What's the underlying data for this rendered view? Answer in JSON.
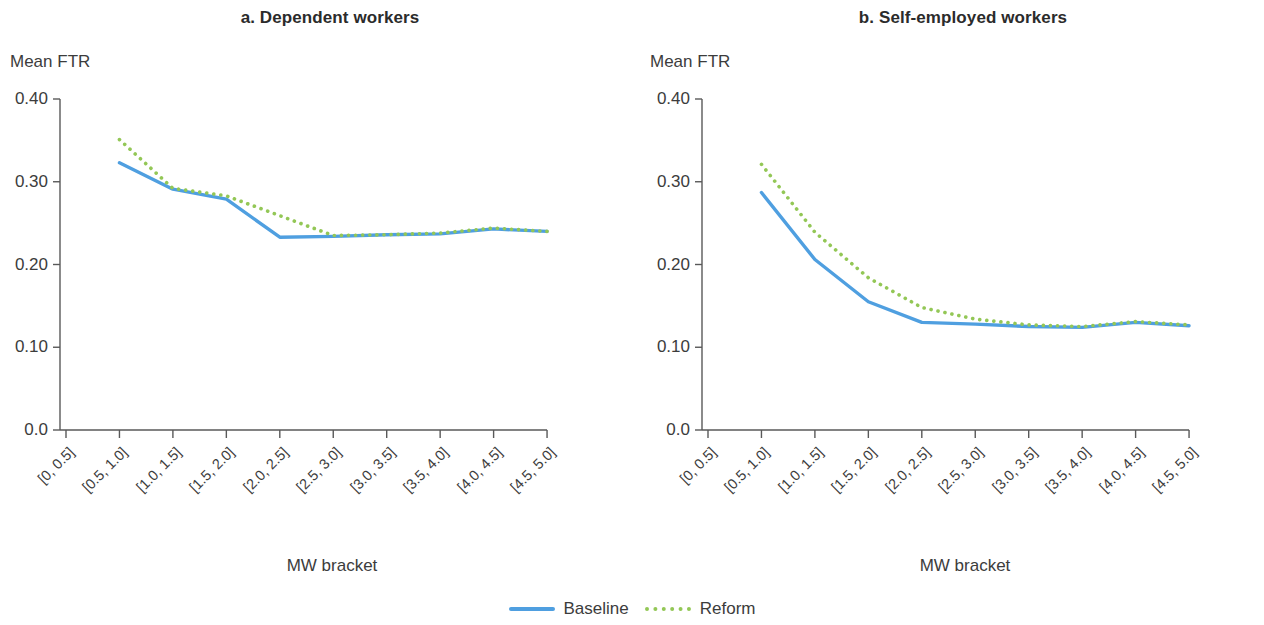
{
  "figure": {
    "background": "#ffffff",
    "series_colors": {
      "baseline": "#4f9fe0",
      "reform": "#93c756"
    }
  },
  "legend": {
    "position": "bottom-center",
    "items": [
      {
        "label": "Baseline",
        "style": "solid",
        "color": "#4f9fe0",
        "icon": "solid-line-swatch"
      },
      {
        "label": "Reform",
        "style": "dotted",
        "color": "#93c756",
        "icon": "dotted-line-swatch"
      }
    ]
  },
  "chart_data": [
    {
      "type": "line",
      "title": "a. Dependent workers",
      "xlabel": "MW bracket",
      "ylabel": "Mean FTR",
      "ylim": [
        0.0,
        0.4
      ],
      "yticks": [
        "0.0",
        "0.10",
        "0.20",
        "0.30",
        "0.40"
      ],
      "ytick_values": [
        0.0,
        0.1,
        0.2,
        0.3,
        0.4
      ],
      "grid": false,
      "legend_position": "bottom-center",
      "categories": [
        "[0, 0.5]",
        "[0.5, 1.0]",
        "[1.0, 1.5]",
        "[1.5, 2.0]",
        "[2.0, 2.5]",
        "[2.5, 3.0]",
        "[3.0, 3.5]",
        "[3.5, 4.0]",
        "[4.0, 4.5]",
        "[4.5, 5.0]"
      ],
      "series": [
        {
          "name": "Baseline",
          "style": "solid",
          "color": "#4f9fe0",
          "values": [
            null,
            0.323,
            0.291,
            0.279,
            0.233,
            0.234,
            0.236,
            0.237,
            0.243,
            0.24
          ]
        },
        {
          "name": "Reform",
          "style": "dotted",
          "color": "#93c756",
          "values": [
            null,
            0.351,
            0.292,
            0.283,
            0.259,
            0.235,
            0.236,
            0.238,
            0.244,
            0.24
          ]
        }
      ]
    },
    {
      "type": "line",
      "title": "b. Self-employed workers",
      "xlabel": "MW bracket",
      "ylabel": "Mean FTR",
      "ylim": [
        0.0,
        0.4
      ],
      "yticks": [
        "0.0",
        "0.10",
        "0.20",
        "0.30",
        "0.40"
      ],
      "ytick_values": [
        0.0,
        0.1,
        0.2,
        0.3,
        0.4
      ],
      "grid": false,
      "legend_position": "bottom-center",
      "categories": [
        "[0, 0.5]",
        "[0.5, 1.0]",
        "[1.0, 1.5]",
        "[1.5, 2.0]",
        "[2.0, 2.5]",
        "[2.5, 3.0]",
        "[3.0, 3.5]",
        "[3.5, 4.0]",
        "[4.0, 4.5]",
        "[4.5, 5.0]"
      ],
      "series": [
        {
          "name": "Baseline",
          "style": "solid",
          "color": "#4f9fe0",
          "values": [
            null,
            0.287,
            0.206,
            0.155,
            0.13,
            0.128,
            0.125,
            0.124,
            0.13,
            0.126
          ]
        },
        {
          "name": "Reform",
          "style": "dotted",
          "color": "#93c756",
          "values": [
            null,
            0.321,
            0.239,
            0.184,
            0.148,
            0.134,
            0.127,
            0.125,
            0.131,
            0.127
          ]
        }
      ]
    }
  ]
}
